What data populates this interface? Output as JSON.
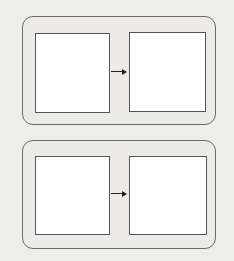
{
  "caption": "me:",
  "colors": {
    "background": "#ededeb",
    "panel_border": "#6a6a6a",
    "box_fill": "#ffffff",
    "box_border": "#555555",
    "arrow": "#222222",
    "particle": "#8a8a8a"
  },
  "panels": [
    {
      "id": "top",
      "description": "Gas atoms condensing into a packed solid",
      "before": {
        "type": "single-atoms",
        "count": 23,
        "positions": [
          [
            48,
            34
          ],
          [
            68,
            33
          ],
          [
            85,
            36
          ],
          [
            53,
            50
          ],
          [
            72,
            47
          ],
          [
            88,
            52
          ],
          [
            39,
            60
          ],
          [
            62,
            60
          ],
          [
            82,
            65
          ],
          [
            95,
            63
          ],
          [
            48,
            70
          ],
          [
            65,
            75
          ],
          [
            85,
            76
          ],
          [
            45,
            82
          ],
          [
            68,
            87
          ],
          [
            90,
            92
          ],
          [
            42,
            100
          ],
          [
            53,
            102
          ],
          [
            67,
            103
          ],
          [
            99,
            101
          ]
        ]
      },
      "arrow": "right",
      "after": {
        "type": "packed-atoms",
        "rows": 4,
        "columns": 6
      }
    },
    {
      "id": "bottom",
      "description": "Diatomic molecules randomly distributed before and after",
      "before": {
        "type": "diatomic-molecules",
        "molecules": [
          {
            "x": 37,
            "y": 162,
            "shade": "light"
          },
          {
            "x": 83,
            "y": 158,
            "shade": "light",
            "rot": -50
          },
          {
            "x": 57,
            "y": 178,
            "shade": "dark",
            "rot": -30
          },
          {
            "x": 75,
            "y": 178,
            "shade": "dark"
          },
          {
            "x": 96,
            "y": 191,
            "shade": "dark",
            "rot": 90
          },
          {
            "x": 44,
            "y": 196,
            "shade": "light",
            "rot": 60
          },
          {
            "x": 73,
            "y": 201,
            "shade": "light",
            "rot": 30
          },
          {
            "x": 71,
            "y": 214,
            "shade": "dark",
            "rot": 90
          },
          {
            "x": 50,
            "y": 220,
            "shade": "dark",
            "rot": 45
          },
          {
            "x": 86,
            "y": 219,
            "shade": "light",
            "rot": -40
          }
        ]
      },
      "arrow": "right",
      "after": {
        "type": "diatomic-molecules",
        "molecules": [
          {
            "x": 160,
            "y": 161,
            "shade": "normal",
            "rot": -70
          },
          {
            "x": 188,
            "y": 166,
            "shade": "light",
            "rot": -80
          },
          {
            "x": 145,
            "y": 173,
            "shade": "normal",
            "rot": 40
          },
          {
            "x": 131,
            "y": 184,
            "shade": "normal"
          },
          {
            "x": 168,
            "y": 188,
            "shade": "normal",
            "rot": -70
          },
          {
            "x": 189,
            "y": 199,
            "shade": "normal",
            "rot": 45
          },
          {
            "x": 135,
            "y": 209,
            "shade": "light",
            "rot": 70
          },
          {
            "x": 164,
            "y": 211,
            "shade": "normal"
          },
          {
            "x": 149,
            "y": 223,
            "shade": "normal",
            "rot": -70
          },
          {
            "x": 184,
            "y": 224,
            "shade": "normal",
            "rot": 40
          }
        ]
      }
    }
  ]
}
